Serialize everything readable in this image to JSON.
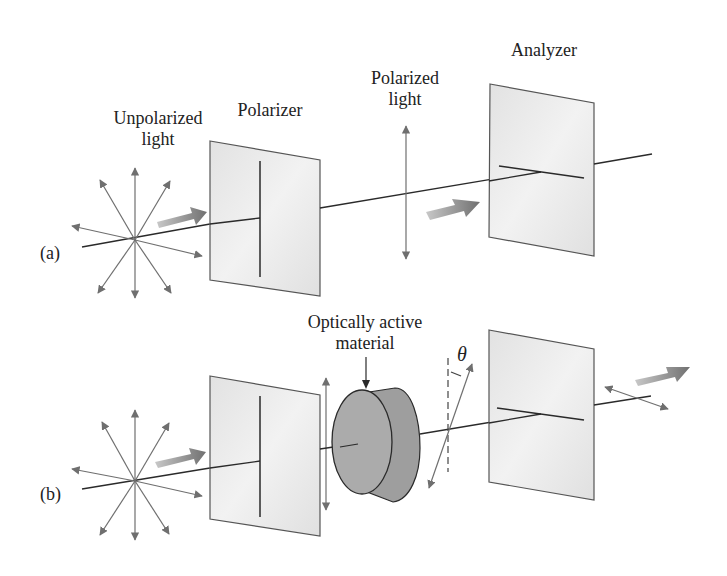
{
  "figure": {
    "panel_a": {
      "tag": "(a)",
      "unpolarized_label_line1": "Unpolarized",
      "unpolarized_label_line2": "light",
      "polarizer_label": "Polarizer",
      "polarized_label_line1": "Polarized",
      "polarized_label_line2": "light",
      "analyzer_label": "Analyzer"
    },
    "panel_b": {
      "tag": "(b)",
      "material_label_line1": "Optically active",
      "material_label_line2": "material",
      "angle_symbol": "θ"
    },
    "colors": {
      "background": "#ffffff",
      "line": "#2a2a2a",
      "arrow_gray": "#6f6f6f",
      "plate_fill": "#e9e9e9",
      "plate_edge": "#555555",
      "cylinder_fill": "#a9a9a9",
      "wide_arrow": "#8a8a8a"
    }
  }
}
